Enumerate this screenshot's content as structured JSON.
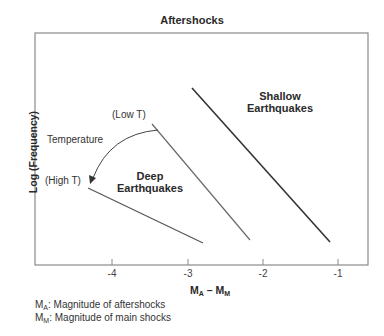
{
  "title": "Aftershocks",
  "y_axis_label": "Log (Frequency)",
  "x_axis": {
    "label_main": "M",
    "label_sub_a": "A",
    "label_dash": " – ",
    "label_sub_m": "M",
    "ticks": [
      "-4",
      "-3",
      "-2",
      "-1"
    ]
  },
  "annotations": {
    "shallow_line1": "Shallow",
    "shallow_line2": "Earthquakes",
    "deep_line1": "Deep",
    "deep_line2": "Earthquakes",
    "low_t": "(Low T)",
    "high_t": "(High T)",
    "temperature": "Temperature"
  },
  "legend_notes": [
    {
      "symbol": "M",
      "sub": "A",
      "text": ": Magnitude of aftershocks"
    },
    {
      "symbol": "M",
      "sub": "M",
      "text": ": Magnitude of main shocks"
    }
  ],
  "colors": {
    "frame": "#8a8a8a",
    "shallow_line": "#333333",
    "deep_line": "#6a6a6a",
    "arrow": "#444444"
  }
}
